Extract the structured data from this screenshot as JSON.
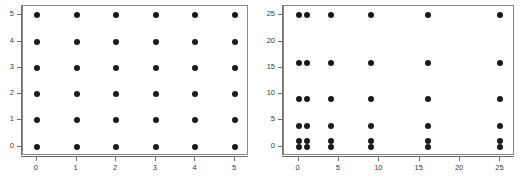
{
  "figure": {
    "background": "#ffffff",
    "point_color": "#1b1b1b",
    "frame_color": "#8a8a8a",
    "axis_color": "#6e6e6e"
  },
  "chart_data": [
    {
      "type": "scatter",
      "title": "",
      "subtitle": "",
      "xlabel": "",
      "ylabel": "",
      "xlim": [
        -0.35,
        5.35
      ],
      "ylim": [
        -0.35,
        5.35
      ],
      "xticks": [
        0,
        1,
        2,
        3,
        4,
        5
      ],
      "yticks": [
        0,
        1,
        2,
        3,
        4,
        5
      ],
      "xticklabels": [
        "0",
        "1",
        "2",
        "3",
        "4",
        "5"
      ],
      "yticklabels": [
        "0",
        "1",
        "2",
        "3",
        "4",
        "5"
      ],
      "grid": false,
      "legend": null,
      "annotations": [],
      "x": [
        0,
        0,
        0,
        0,
        0,
        0,
        1,
        1,
        1,
        1,
        1,
        1,
        2,
        2,
        2,
        2,
        2,
        2,
        3,
        3,
        3,
        3,
        3,
        3,
        4,
        4,
        4,
        4,
        4,
        4,
        5,
        5,
        5,
        5,
        5,
        5
      ],
      "y": [
        0,
        1,
        2,
        3,
        4,
        5,
        0,
        1,
        2,
        3,
        4,
        5,
        0,
        1,
        2,
        3,
        4,
        5,
        0,
        1,
        2,
        3,
        4,
        5,
        0,
        1,
        2,
        3,
        4,
        5,
        0,
        1,
        2,
        3,
        4,
        5
      ]
    },
    {
      "type": "scatter",
      "title": "",
      "subtitle": "",
      "xlabel": "",
      "ylabel": "",
      "xlim": [
        -1.8,
        26.8
      ],
      "ylim": [
        -1.8,
        26.8
      ],
      "xticks": [
        0,
        5,
        10,
        15,
        20,
        25
      ],
      "yticks": [
        0,
        5,
        10,
        15,
        20,
        25
      ],
      "xticklabels": [
        "0",
        "5",
        "10",
        "15",
        "20",
        "25"
      ],
      "yticklabels": [
        "0",
        "5",
        "10",
        "15",
        "20",
        "25"
      ],
      "grid": false,
      "legend": null,
      "annotations": [],
      "x": [
        0,
        0,
        0,
        0,
        0,
        0,
        1,
        1,
        1,
        1,
        1,
        1,
        4,
        4,
        4,
        4,
        4,
        4,
        9,
        9,
        9,
        9,
        9,
        9,
        16,
        16,
        16,
        16,
        16,
        16,
        25,
        25,
        25,
        25,
        25,
        25
      ],
      "y": [
        0,
        1,
        4,
        9,
        16,
        25,
        0,
        1,
        4,
        9,
        16,
        25,
        0,
        1,
        4,
        9,
        16,
        25,
        0,
        1,
        4,
        9,
        16,
        25,
        0,
        1,
        4,
        9,
        16,
        25,
        0,
        1,
        4,
        9,
        16,
        25
      ]
    }
  ]
}
